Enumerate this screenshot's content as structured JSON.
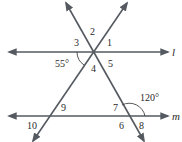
{
  "diagram": {
    "type": "parallel lines cut by two transversals",
    "lines": {
      "l": {
        "label": "l",
        "y": 52
      },
      "m": {
        "label": "m",
        "y": 116
      }
    },
    "angle_labels": {
      "a1": "1",
      "a2": "2",
      "a3": "3",
      "a4": "4",
      "a5": "5",
      "a6": "6",
      "a7": "7",
      "a8": "8",
      "a9": "9",
      "a10": "10"
    },
    "given_angles": {
      "left": "55°",
      "right": "120°"
    },
    "colors": {
      "line": "#555a60",
      "text": "#2a2a2a",
      "background": "#ffffff"
    }
  }
}
